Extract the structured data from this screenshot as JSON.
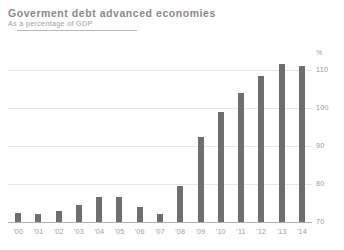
{
  "header": {
    "title": "Goverment debt advanced economies",
    "subtitle": "As a percentage of GDP",
    "rule": "horizontal-rule"
  },
  "axis": {
    "unit_label": "%",
    "y_ticks": [
      "110",
      "100",
      "90",
      "80",
      "70"
    ]
  },
  "chart_data": {
    "type": "bar",
    "title": "Goverment debt advanced economies",
    "subtitle": "As a percentage of GDP",
    "xlabel": "",
    "ylabel": "%",
    "ylim": [
      70,
      114
    ],
    "y_ticks": [
      70,
      80,
      90,
      100,
      110
    ],
    "grid": true,
    "legend": "none",
    "bar_color": "#6e6e6e",
    "categories": [
      "'00",
      "'01",
      "'02",
      "'03",
      "'04",
      "'05",
      "'06",
      "'07",
      "'08",
      "'09",
      "'10",
      "'11",
      "'12",
      "'13",
      "'14"
    ],
    "values": [
      72.5,
      72.0,
      73.0,
      74.5,
      76.5,
      76.5,
      74.0,
      72.0,
      79.5,
      92.5,
      99.0,
      104.0,
      108.5,
      111.5,
      111.0
    ]
  }
}
